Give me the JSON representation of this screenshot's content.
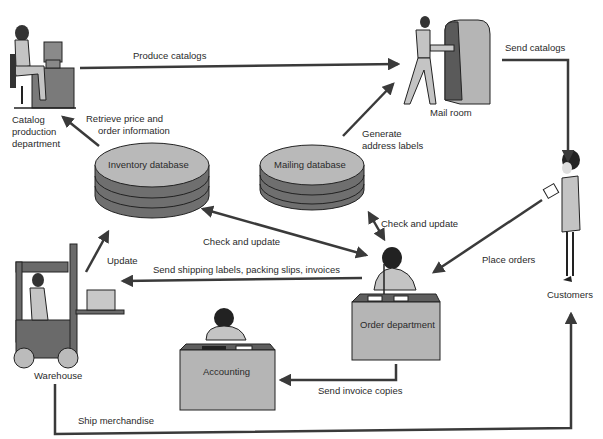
{
  "colors": {
    "background": "#ffffff",
    "arrow": "#3a3a3a",
    "db_top": "#b9b9b9",
    "db_side": "#6f6f6f",
    "desk_front": "#b5b5b5",
    "desk_top": "#5e5e5e",
    "figure_fill": "#c4c4c4",
    "figure_dark": "#2a2a2a"
  },
  "nodes": {
    "catalog": {
      "label_lines": [
        "Catalog",
        "production",
        "department"
      ]
    },
    "mailroom": {
      "label": "Mail room"
    },
    "customers": {
      "label": "Customers"
    },
    "inventory_db": {
      "label": "Inventory database"
    },
    "mailing_db": {
      "label": "Mailing database"
    },
    "warehouse": {
      "label": "Warehouse"
    },
    "order_dept": {
      "label": "Order department"
    },
    "accounting": {
      "label": "Accounting"
    }
  },
  "edges": {
    "produce_catalogs": "Produce catalogs",
    "send_catalogs": "Send catalogs",
    "retrieve_line1": "Retrieve price and",
    "retrieve_line2": "order information",
    "generate_line1": "Generate",
    "generate_line2": "address labels",
    "check_update_mailing": "Check and update",
    "check_update_inventory": "Check and update",
    "place_orders": "Place orders",
    "update": "Update",
    "send_shipping": "Send shipping labels, packing slips, invoices",
    "send_invoice": "Send invoice copies",
    "ship_merchandise": "Ship merchandise"
  }
}
